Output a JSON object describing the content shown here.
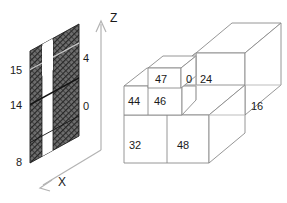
{
  "figure": {
    "title": "",
    "panels": {
      "left": {
        "name": "slanted-plane-panel",
        "axes": {
          "z_label": "Z",
          "x_label": "X"
        },
        "labels_left": [
          "15",
          "14",
          "8"
        ],
        "labels_right": [
          "4",
          "0"
        ],
        "fill": "hatched-dark",
        "stripe": "white-vertical-band"
      },
      "right": {
        "name": "isometric-block-panel",
        "block_labels": {
          "top_small_front": "47",
          "mid_left_front": "44",
          "mid_right_front": "46",
          "narrow_front": "0",
          "tall_front": "24",
          "tall_right_side": "16",
          "base_left_front": "32",
          "base_right_front": "48"
        }
      }
    },
    "colors": {
      "line": "#8a8a8a",
      "line_dark": "#4d4d4d",
      "text": "#1a1a1a",
      "hatch": "#3a3a3a",
      "background": "#ffffff"
    }
  }
}
